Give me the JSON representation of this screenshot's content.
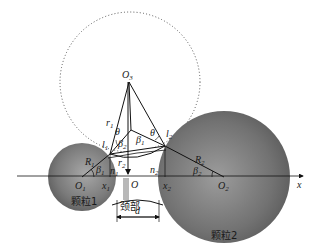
{
  "figure": {
    "type": "sintering-neck-geometry",
    "axis_label": "x",
    "particles": [
      {
        "id": "particle1",
        "label": "颗粒1",
        "center_label": "O",
        "center_sub": "1",
        "radius_label": "R",
        "radius_sub": "1",
        "angle_label": "β",
        "angle_sub": "1"
      },
      {
        "id": "particle2",
        "label": "颗粒2",
        "center_label": "O",
        "center_sub": "2",
        "radius_label": "R",
        "radius_sub": "2",
        "angle_label": "β",
        "angle_sub": "2"
      }
    ],
    "neck_circle": {
      "center_label": "O",
      "center_sub": "3",
      "radius_label": "r",
      "radius_sub": "1"
    },
    "neck": {
      "label": "颈部",
      "width_label": "d",
      "radius_label": "r",
      "radius_sub": "2",
      "origin_label": "O"
    },
    "points": {
      "l1": {
        "label": "l",
        "sub": "1"
      },
      "l2": {
        "label": "l",
        "sub": "2"
      },
      "x1": {
        "label": "x",
        "sub": "1"
      },
      "x2": {
        "label": "x",
        "sub": "2"
      },
      "n1": {
        "label": "n",
        "sub": "1"
      },
      "n2": {
        "label": "n",
        "sub": "2"
      }
    },
    "angles": {
      "theta": "θ",
      "beta1": {
        "label": "β",
        "sub": "1"
      },
      "beta2": {
        "label": "β",
        "sub": "2"
      }
    },
    "colors": {
      "particle_fill": "#6e6e6e",
      "particle_highlight": "#9a9a9a",
      "line": "#111111",
      "dotted": "#555555"
    }
  }
}
